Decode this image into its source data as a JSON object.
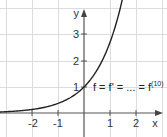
{
  "chart_data": {
    "type": "line",
    "title": "",
    "xlabel": "x",
    "ylabel": "y",
    "xlim": [
      -3.1,
      3.0
    ],
    "ylim": [
      -0.9,
      4.35
    ],
    "grid": true,
    "x_ticks": [
      -2,
      -1,
      1,
      2
    ],
    "y_ticks": [
      1,
      2,
      3
    ],
    "series": [
      {
        "name": "f = f' = ... = f^(10)",
        "function": "e^x",
        "x": [
          -3,
          -2.5,
          -2,
          -1.5,
          -1,
          -0.5,
          0,
          0.5,
          1,
          1.25,
          1.47
        ],
        "y": [
          0.05,
          0.08,
          0.14,
          0.22,
          0.37,
          0.61,
          1.0,
          1.65,
          2.72,
          3.49,
          4.35
        ]
      }
    ],
    "annotations": [
      {
        "text_main": "f = f' = ... = f",
        "text_sup": "(10)",
        "x": 0.3,
        "y": 1.0
      }
    ],
    "colors": {
      "curve": "#222222",
      "axis": "#555555",
      "grid": "#dddddd"
    }
  },
  "labels": {
    "x_axis": "x",
    "y_axis": "y",
    "x_tick_neg2": "-2",
    "x_tick_neg1": "-1",
    "x_tick_1": "1",
    "x_tick_2": "2",
    "y_tick_1": "1",
    "y_tick_2": "2",
    "y_tick_3": "3",
    "equation_main": "f = f' = ... = f",
    "equation_sup": "(10)"
  }
}
